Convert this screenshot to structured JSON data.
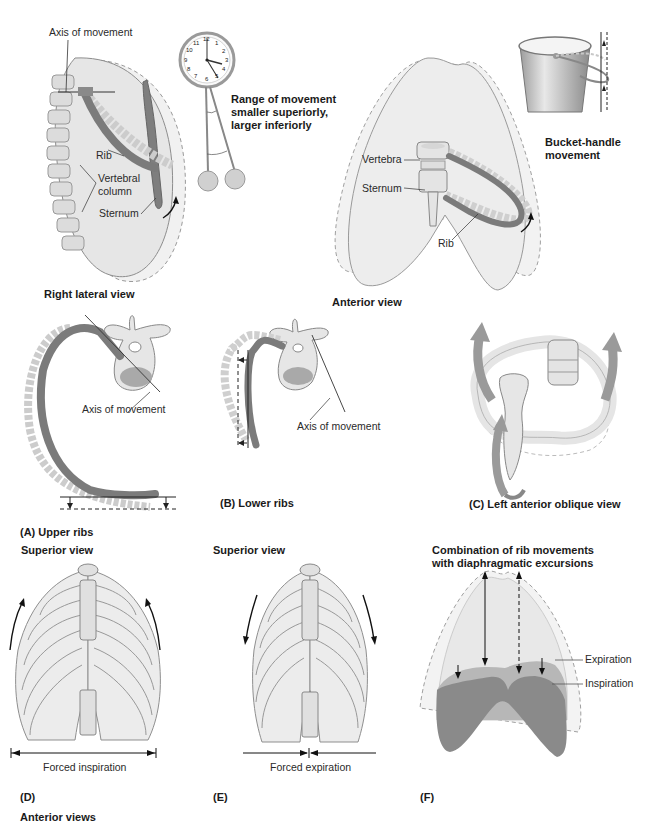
{
  "figure": {
    "panel_lateral": {
      "axis_label": "Axis of movement",
      "rib_label": "Rib",
      "vertebral_label_1": "Vertebral",
      "vertebral_label_2": "column",
      "sternum_label": "Sternum",
      "caption": "Right lateral view"
    },
    "pendulum": {
      "line1": "Range of movement",
      "line2": "smaller superiorly,",
      "line3": "larger inferiorly",
      "clock_numbers": [
        "12",
        "1",
        "2",
        "3",
        "4",
        "5",
        "6",
        "7",
        "8",
        "9",
        "10",
        "11"
      ]
    },
    "panel_anterior": {
      "vertebra_label": "Vertebra",
      "sternum_label": "Sternum",
      "rib_label": "Rib",
      "caption": "Anterior view"
    },
    "bucket": {
      "line1": "Bucket-handle",
      "line2": "movement"
    },
    "panel_A": {
      "axis_label": "Axis of movement",
      "caption": "(A) Upper ribs"
    },
    "panel_B": {
      "axis_label": "Axis of movement",
      "caption": "(B) Lower ribs"
    },
    "panel_C": {
      "caption": "(C) Left anterior oblique view"
    },
    "panel_D": {
      "heading": "Superior view",
      "measure_label": "Forced inspiration",
      "caption": "(D)"
    },
    "panel_E": {
      "heading": "Superior view",
      "measure_label": "Forced expiration",
      "caption": "(E)"
    },
    "panel_F": {
      "heading_1": "Combination of rib movements",
      "heading_2": "with diaphragmatic excursions",
      "expiration_label": "Expiration",
      "inspiration_label": "Inspiration",
      "caption": "(F)"
    },
    "footer_caption": "Anterior views"
  },
  "colors": {
    "bone_fill": "#e4e4e4",
    "bone_stroke": "#8a8a8a",
    "rib_dark": "#7b7b7b",
    "rib_light": "#c9c9c9",
    "lung_fill": "#ececec",
    "diaphragm_dark": "#8c8c8c",
    "diaphragm_mid": "#b3b3b3",
    "text": "#1a1a1a"
  }
}
